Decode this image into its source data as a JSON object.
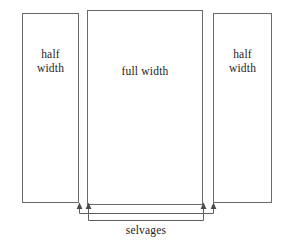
{
  "figure": {
    "type": "textile-fabric-layout-diagram",
    "background_color": "#ffffff",
    "line_color": "#6a6a6a",
    "text_color": "#1d1d1d"
  },
  "panels": [
    {
      "id": "left-half-panel",
      "label_line1": "half",
      "label_line2": "width",
      "x": 22,
      "y": 13,
      "width": 57,
      "height": 190
    },
    {
      "id": "full-width-panel",
      "label_line1": "full width",
      "label_line2": "",
      "x": 87,
      "y": 10,
      "width": 116,
      "height": 195
    },
    {
      "id": "right-half-panel",
      "label_line1": "half",
      "label_line2": "width",
      "x": 213,
      "y": 13,
      "width": 59,
      "height": 190
    }
  ],
  "annotation": {
    "label": "selvages",
    "arrow_count": 4,
    "arrow_x_positions": [
      79,
      88,
      203,
      213
    ],
    "outer_bracket_y": 213,
    "inner_bracket_y": 220
  }
}
